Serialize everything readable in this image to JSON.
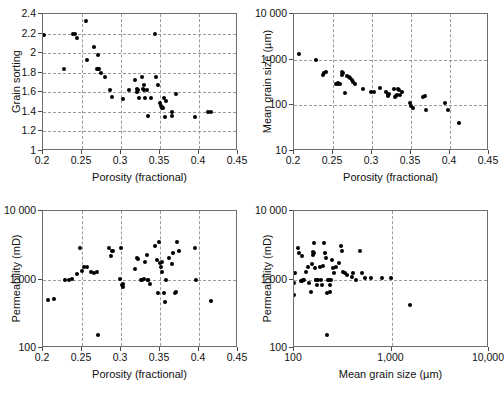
{
  "figure": {
    "background": "#ffffff",
    "point_color": "#000000",
    "grid_color": "#9a9a9a",
    "frame_color": "#6e6e6e"
  },
  "chart_data": [
    {
      "panel": "top-left",
      "type": "scatter",
      "title": "",
      "xlabel": "Porosity (fractional)",
      "ylabel": "Grain sorting",
      "xscale": "linear",
      "yscale": "linear",
      "xlim": [
        0.2,
        0.45
      ],
      "ylim": [
        1,
        2.4
      ],
      "xticks": [
        0.2,
        0.25,
        0.3,
        0.35,
        0.4,
        0.45
      ],
      "xticklabels": [
        "0.2",
        "0.25",
        "0.3",
        "0.35",
        "0.4",
        "0.45"
      ],
      "yticks": [
        1,
        1.2,
        1.4,
        1.6,
        1.8,
        2,
        2.2,
        2.4
      ],
      "yticklabels": [
        "1",
        "1.2",
        "1.4",
        "1.6",
        "1.8",
        "2",
        "2.2",
        "2.4"
      ],
      "grid": true,
      "grid_axes": "both",
      "legend": "none",
      "points": [
        [
          0.201,
          2.19
        ],
        [
          0.227,
          1.84
        ],
        [
          0.238,
          2.2
        ],
        [
          0.241,
          2.2
        ],
        [
          0.243,
          2.15
        ],
        [
          0.255,
          2.33
        ],
        [
          0.256,
          1.93
        ],
        [
          0.266,
          2.06
        ],
        [
          0.269,
          1.84
        ],
        [
          0.27,
          1.84
        ],
        [
          0.271,
          1.98
        ],
        [
          0.272,
          1.84
        ],
        [
          0.274,
          1.8
        ],
        [
          0.279,
          1.76
        ],
        [
          0.286,
          1.62
        ],
        [
          0.288,
          1.55
        ],
        [
          0.302,
          1.53
        ],
        [
          0.31,
          1.62
        ],
        [
          0.318,
          1.73
        ],
        [
          0.32,
          1.63
        ],
        [
          0.321,
          1.6
        ],
        [
          0.322,
          1.62
        ],
        [
          0.323,
          1.54
        ],
        [
          0.327,
          1.76
        ],
        [
          0.328,
          1.63
        ],
        [
          0.329,
          1.62
        ],
        [
          0.33,
          1.67
        ],
        [
          0.331,
          1.54
        ],
        [
          0.333,
          1.62
        ],
        [
          0.335,
          1.36
        ],
        [
          0.338,
          1.54
        ],
        [
          0.344,
          2.2
        ],
        [
          0.345,
          1.76
        ],
        [
          0.348,
          1.67
        ],
        [
          0.35,
          1.49
        ],
        [
          0.351,
          1.46
        ],
        [
          0.352,
          1.44
        ],
        [
          0.353,
          1.45
        ],
        [
          0.354,
          1.44
        ],
        [
          0.355,
          1.54
        ],
        [
          0.356,
          1.35
        ],
        [
          0.358,
          1.51
        ],
        [
          0.365,
          1.4
        ],
        [
          0.366,
          1.36
        ],
        [
          0.371,
          1.58
        ],
        [
          0.395,
          1.35
        ],
        [
          0.412,
          1.4
        ],
        [
          0.416,
          1.4
        ]
      ]
    },
    {
      "panel": "top-right",
      "type": "scatter",
      "title": "",
      "xlabel": "Porosity (fractional)",
      "ylabel": "Mean grain size (µm)",
      "xscale": "linear",
      "yscale": "log",
      "xlim": [
        0.2,
        0.45
      ],
      "ylim": [
        10,
        10000
      ],
      "xticks": [
        0.2,
        0.25,
        0.3,
        0.35,
        0.4,
        0.45
      ],
      "xticklabels": [
        "0.2",
        "0.25",
        "0.3",
        "0.35",
        "0.4",
        "0.45"
      ],
      "yticks": [
        10,
        100,
        1000,
        10000
      ],
      "yticklabels": [
        "10",
        "100",
        "1 000",
        "10 000"
      ],
      "grid": true,
      "grid_axes": "both",
      "legend": "none",
      "points": [
        [
          0.207,
          1300
        ],
        [
          0.228,
          980
        ],
        [
          0.237,
          470
        ],
        [
          0.239,
          520
        ],
        [
          0.241,
          540
        ],
        [
          0.254,
          300
        ],
        [
          0.256,
          310
        ],
        [
          0.257,
          290
        ],
        [
          0.259,
          300
        ],
        [
          0.261,
          530
        ],
        [
          0.262,
          470
        ],
        [
          0.263,
          500
        ],
        [
          0.265,
          190
        ],
        [
          0.268,
          430
        ],
        [
          0.27,
          420
        ],
        [
          0.272,
          390
        ],
        [
          0.274,
          360
        ],
        [
          0.276,
          320
        ],
        [
          0.278,
          300
        ],
        [
          0.288,
          230
        ],
        [
          0.299,
          200
        ],
        [
          0.302,
          200
        ],
        [
          0.31,
          240
        ],
        [
          0.318,
          200
        ],
        [
          0.32,
          170
        ],
        [
          0.321,
          160
        ],
        [
          0.322,
          180
        ],
        [
          0.328,
          230
        ],
        [
          0.33,
          150
        ],
        [
          0.331,
          160
        ],
        [
          0.332,
          165
        ],
        [
          0.333,
          230
        ],
        [
          0.334,
          220
        ],
        [
          0.336,
          170
        ],
        [
          0.338,
          195
        ],
        [
          0.349,
          110
        ],
        [
          0.35,
          95
        ],
        [
          0.352,
          88
        ],
        [
          0.366,
          150
        ],
        [
          0.368,
          160
        ],
        [
          0.369,
          80
        ],
        [
          0.394,
          110
        ],
        [
          0.398,
          78
        ],
        [
          0.412,
          42
        ]
      ]
    },
    {
      "panel": "bottom-left",
      "type": "scatter",
      "title": "",
      "xlabel": "Porosity (fractional)",
      "ylabel": "Permeability (mD)",
      "xscale": "linear",
      "yscale": "log",
      "xlim": [
        0.2,
        0.45
      ],
      "ylim": [
        100,
        10000
      ],
      "xticks": [
        0.2,
        0.25,
        0.3,
        0.35,
        0.4,
        0.45
      ],
      "xticklabels": [
        "0.2",
        "0.25",
        "0.3",
        "0.35",
        "0.4",
        "0.45"
      ],
      "yticks": [
        100,
        1000,
        10000
      ],
      "yticklabels": [
        "100",
        "1 000",
        "10 000"
      ],
      "grid": true,
      "grid_axes": "both",
      "legend": "none",
      "points": [
        [
          0.207,
          510
        ],
        [
          0.214,
          515
        ],
        [
          0.228,
          1000
        ],
        [
          0.233,
          1000
        ],
        [
          0.237,
          1010
        ],
        [
          0.244,
          1200
        ],
        [
          0.247,
          2900
        ],
        [
          0.25,
          1350
        ],
        [
          0.253,
          1500
        ],
        [
          0.256,
          1520
        ],
        [
          0.262,
          1300
        ],
        [
          0.266,
          1250
        ],
        [
          0.269,
          1280
        ],
        [
          0.27,
          155
        ],
        [
          0.285,
          2900
        ],
        [
          0.287,
          2200
        ],
        [
          0.289,
          2600
        ],
        [
          0.29,
          2600
        ],
        [
          0.299,
          1030
        ],
        [
          0.3,
          2900
        ],
        [
          0.301,
          830
        ],
        [
          0.302,
          870
        ],
        [
          0.303,
          790
        ],
        [
          0.318,
          1400
        ],
        [
          0.32,
          2050
        ],
        [
          0.322,
          2000
        ],
        [
          0.325,
          1000
        ],
        [
          0.327,
          990
        ],
        [
          0.329,
          1010
        ],
        [
          0.331,
          1800
        ],
        [
          0.333,
          2300
        ],
        [
          0.334,
          1000
        ],
        [
          0.335,
          980
        ],
        [
          0.337,
          860
        ],
        [
          0.344,
          3100
        ],
        [
          0.346,
          1900
        ],
        [
          0.348,
          640
        ],
        [
          0.349,
          3500
        ],
        [
          0.35,
          1750
        ],
        [
          0.351,
          1500
        ],
        [
          0.352,
          1800
        ],
        [
          0.353,
          1300
        ],
        [
          0.355,
          640
        ],
        [
          0.356,
          470
        ],
        [
          0.358,
          1000
        ],
        [
          0.362,
          2050
        ],
        [
          0.365,
          1700
        ],
        [
          0.367,
          2400
        ],
        [
          0.369,
          640
        ],
        [
          0.371,
          650
        ],
        [
          0.372,
          3500
        ],
        [
          0.374,
          2600
        ],
        [
          0.395,
          2900
        ],
        [
          0.396,
          980
        ],
        [
          0.415,
          480
        ]
      ]
    },
    {
      "panel": "bottom-right",
      "type": "scatter",
      "title": "",
      "xlabel": "Mean grain size (µm)",
      "ylabel": "Permeability (mD)",
      "xscale": "log",
      "yscale": "log",
      "xlim": [
        100,
        10000
      ],
      "ylim": [
        100,
        10000
      ],
      "xticks": [
        100,
        1000,
        10000
      ],
      "xticklabels": [
        "100",
        "1,000",
        "10,000"
      ],
      "yticks": [
        100,
        1000,
        10000
      ],
      "yticklabels": [
        "100",
        "1 000",
        "10 000"
      ],
      "grid": true,
      "grid_axes": "both",
      "legend": "none",
      "points": [
        [
          100,
          600
        ],
        [
          101,
          880
        ],
        [
          103,
          1250
        ],
        [
          110,
          2900
        ],
        [
          112,
          2450
        ],
        [
          118,
          950
        ],
        [
          120,
          940
        ],
        [
          122,
          2200
        ],
        [
          125,
          1000
        ],
        [
          128,
          1000
        ],
        [
          132,
          1300
        ],
        [
          140,
          1500
        ],
        [
          142,
          900
        ],
        [
          148,
          650
        ],
        [
          152,
          1700
        ],
        [
          155,
          2300
        ],
        [
          158,
          2500
        ],
        [
          160,
          2450
        ],
        [
          162,
          3400
        ],
        [
          165,
          1450
        ],
        [
          168,
          990
        ],
        [
          170,
          1000
        ],
        [
          172,
          820
        ],
        [
          178,
          1000
        ],
        [
          185,
          1500
        ],
        [
          190,
          980
        ],
        [
          195,
          820
        ],
        [
          200,
          1550
        ],
        [
          205,
          3450
        ],
        [
          210,
          2400
        ],
        [
          215,
          2050
        ],
        [
          218,
          640
        ],
        [
          220,
          155
        ],
        [
          225,
          1000
        ],
        [
          230,
          980
        ],
        [
          232,
          820
        ],
        [
          235,
          650
        ],
        [
          240,
          1000
        ],
        [
          245,
          1900
        ],
        [
          250,
          1450
        ],
        [
          255,
          1250
        ],
        [
          270,
          1500
        ],
        [
          290,
          1750
        ],
        [
          300,
          3100
        ],
        [
          310,
          2600
        ],
        [
          320,
          1300
        ],
        [
          330,
          1250
        ],
        [
          350,
          1150
        ],
        [
          390,
          1100
        ],
        [
          400,
          1250
        ],
        [
          430,
          1000
        ],
        [
          470,
          2600
        ],
        [
          500,
          1250
        ],
        [
          540,
          1050
        ],
        [
          620,
          1050
        ],
        [
          800,
          1050
        ],
        [
          980,
          1050
        ],
        [
          1550,
          430
        ]
      ]
    }
  ]
}
